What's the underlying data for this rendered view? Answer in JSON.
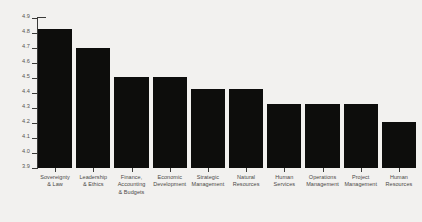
{
  "chart_data": {
    "type": "bar",
    "title": "",
    "xlabel": "",
    "ylabel": "",
    "ylim": [
      3.9,
      4.9
    ],
    "grid": false,
    "legend": null,
    "orientation": "vertical",
    "bar_color": "#0d0d0c",
    "background_color": "#f2f1ef",
    "axis_color": "#3a3a38",
    "categories": [
      "Sovereignty\n& Law",
      "Leadership\n& Ethics",
      "Finance,\nAccounting\n& Budgets",
      "Economic\nDevelopment",
      "Strategic\nManagement",
      "Natural\nResources",
      "Human\nServices",
      "Operations\nManagement",
      "Project\nManagement",
      "Human\nResources"
    ],
    "values": [
      4.83,
      4.7,
      4.51,
      4.51,
      4.43,
      4.43,
      4.33,
      4.33,
      4.33,
      4.21
    ],
    "ytick_labels": [
      "4.9",
      "4.8",
      "4.7",
      "4.6",
      "4.5",
      "4.4",
      "4.3",
      "4.2",
      "4.1",
      "4.0",
      "3.9"
    ],
    "ytick_values": [
      4.9,
      4.8,
      4.7,
      4.6,
      4.5,
      4.4,
      4.3,
      4.2,
      4.1,
      4.0,
      3.9
    ]
  }
}
